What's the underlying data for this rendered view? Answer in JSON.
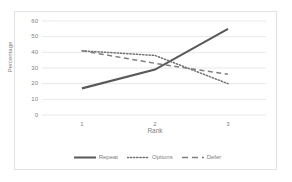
{
  "chart_data": {
    "type": "line",
    "title": "",
    "xlabel": "Rank",
    "ylabel": "Percentage",
    "categories": [
      "1",
      "2",
      "3"
    ],
    "x": [
      1,
      2,
      3
    ],
    "xlim": [
      1,
      3
    ],
    "ylim": [
      0,
      60
    ],
    "yticks": [
      0,
      10,
      20,
      30,
      40,
      50,
      60
    ],
    "ytick_labels": [
      "0",
      "10",
      "20",
      "30",
      "40",
      "50",
      "60"
    ],
    "xtick_labels": [
      "1",
      "2",
      "3"
    ],
    "grid": "horizontal",
    "legend_position": "bottom",
    "series": [
      {
        "name": "Repeat",
        "values": [
          17,
          29,
          55
        ],
        "style": "solid",
        "color": "#595959"
      },
      {
        "name": "Options",
        "values": [
          41,
          38,
          20
        ],
        "style": "dotted",
        "color": "#737373"
      },
      {
        "name": "Defer",
        "values": [
          41,
          33,
          26
        ],
        "style": "dashed",
        "color": "#7f7f7f"
      }
    ]
  },
  "axis": {
    "ylabel": "Percentage",
    "xlabel": "Rank",
    "ytick_0": "0",
    "ytick_10": "10",
    "ytick_20": "20",
    "ytick_30": "30",
    "ytick_40": "40",
    "ytick_50": "50",
    "ytick_60": "60",
    "xtick_1": "1",
    "xtick_2": "2",
    "xtick_3": "3"
  },
  "legend": {
    "items": [
      {
        "label": "Repeat"
      },
      {
        "label": "Options"
      },
      {
        "label": "Defer"
      }
    ]
  },
  "colors": {
    "grid": "#e8e8e8",
    "frame": "#e2e2e2",
    "text": "#808080",
    "series_repeat": "#595959",
    "series_options": "#737373",
    "series_defer": "#7f7f7f"
  }
}
